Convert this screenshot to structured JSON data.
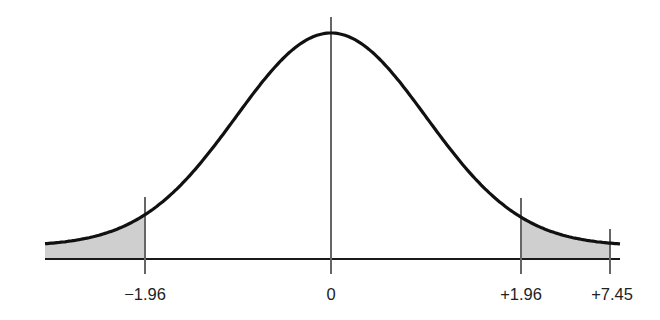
{
  "diagram": {
    "type": "normal-distribution",
    "mean_label": "0",
    "tick_labels": [
      "−1.96",
      "0",
      "+1.96",
      "+7.45"
    ],
    "shaded_regions": [
      {
        "name": "left-tail",
        "from": "-inf",
        "to": "-1.96"
      },
      {
        "name": "right-tail",
        "from": "+1.96",
        "to": "+7.45"
      }
    ],
    "colors": {
      "curve": "#111111",
      "axis": "#1a1a1a",
      "marker_lines": "#666666",
      "shade": "#cfcfcf",
      "background": "#ffffff"
    }
  },
  "labels": {
    "neg196": "−1.96",
    "zero": "0",
    "pos196": "+1.96",
    "pos745": "+7.45"
  }
}
